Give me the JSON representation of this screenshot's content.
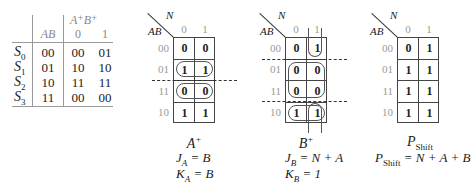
{
  "state_table": {
    "header_group": "A⁺B⁺",
    "col_ab": "AB",
    "col_0": "0",
    "col_1": "1",
    "rows": [
      {
        "state": "S",
        "idx": "0",
        "ab": "00",
        "n0": "00",
        "n1": "01"
      },
      {
        "state": "S",
        "idx": "1",
        "ab": "01",
        "n0": "10",
        "n1": "10"
      },
      {
        "state": "S",
        "idx": "2",
        "ab": "10",
        "n0": "11",
        "n1": "11"
      },
      {
        "state": "S",
        "idx": "3",
        "ab": "11",
        "n0": "00",
        "n1": "00"
      }
    ]
  },
  "kmap_axes": {
    "col_var": "N",
    "row_var": "AB",
    "col_labels": [
      "0",
      "1"
    ],
    "row_labels": [
      "00",
      "01",
      "11",
      "10"
    ]
  },
  "kmaps": [
    {
      "name": "A+",
      "caption_main": "A",
      "caption_sup": "+",
      "cells": [
        [
          "0",
          "0"
        ],
        [
          "1",
          "1"
        ],
        [
          "0",
          "0"
        ],
        [
          "1",
          "1"
        ]
      ],
      "equations": [
        {
          "lhs": "J",
          "sub": "A",
          "rhs": " = B"
        },
        {
          "lhs": "K",
          "sub": "A",
          "rhs": " = B"
        }
      ]
    },
    {
      "name": "B+",
      "caption_main": "B",
      "caption_sup": "+",
      "cells": [
        [
          "0",
          "1"
        ],
        [
          "0",
          "0"
        ],
        [
          "0",
          "0"
        ],
        [
          "1",
          "1"
        ]
      ],
      "equations": [
        {
          "lhs": "J",
          "sub": "B",
          "rhs": " = N + A"
        },
        {
          "lhs": "K",
          "sub": "B",
          "rhs": " = 1"
        }
      ]
    },
    {
      "name": "PShift",
      "caption_main": "P",
      "caption_sub": "Shift",
      "cells": [
        [
          "0",
          "1"
        ],
        [
          "1",
          "1"
        ],
        [
          "1",
          "1"
        ],
        [
          "1",
          "1"
        ]
      ],
      "equations": [
        {
          "lhs": "P",
          "sub": "Shift",
          "rhs": " = N + A + B"
        }
      ]
    }
  ]
}
